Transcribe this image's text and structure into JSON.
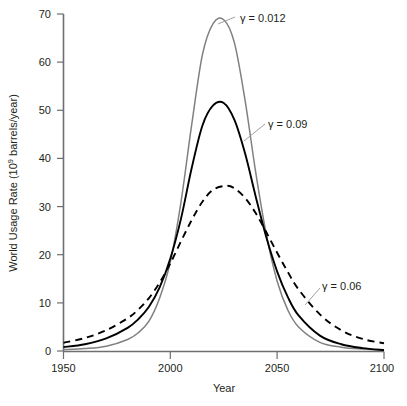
{
  "chart_data": {
    "type": "line",
    "title": "",
    "xlabel": "Year",
    "ylabel": "World Usage Rate (10⁹ barrels/year)",
    "xlim": [
      1950,
      2100
    ],
    "ylim": [
      0,
      70
    ],
    "xticks": [
      1950,
      2000,
      2050,
      2100
    ],
    "yticks": [
      0,
      10,
      20,
      30,
      40,
      50,
      60,
      70
    ],
    "grid": false,
    "legend_position": "inline-annotations",
    "series": [
      {
        "name": "γ = 0.012",
        "style": "solid",
        "color": "#808080",
        "peak_year": 2025,
        "peak_value": 68.8,
        "x": [
          1950,
          1960,
          1970,
          1980,
          1985,
          1990,
          1995,
          2000,
          2005,
          2010,
          2015,
          2020,
          2025,
          2030,
          2035,
          2040,
          2045,
          2050,
          2055,
          2060,
          2070,
          2080,
          2090,
          2100
        ],
        "y": [
          0.3,
          0.5,
          1.0,
          2.4,
          3.8,
          6.2,
          11.0,
          18.5,
          31.0,
          47.0,
          61.5,
          68.0,
          68.8,
          64.0,
          52.0,
          37.0,
          24.0,
          14.5,
          8.5,
          5.0,
          1.8,
          0.8,
          0.4,
          0.2
        ]
      },
      {
        "name": "γ = 0.09",
        "style": "solid",
        "color": "#000000",
        "peak_year": 2025,
        "peak_value": 51.5,
        "x": [
          1950,
          1960,
          1970,
          1980,
          1985,
          1990,
          1995,
          2000,
          2005,
          2010,
          2015,
          2020,
          2025,
          2030,
          2035,
          2040,
          2045,
          2050,
          2055,
          2060,
          2070,
          2080,
          2090,
          2100
        ],
        "y": [
          0.8,
          1.4,
          2.6,
          4.8,
          6.6,
          9.2,
          13.2,
          19.2,
          27.5,
          38.0,
          46.8,
          51.0,
          51.5,
          48.0,
          41.0,
          32.0,
          23.5,
          16.5,
          11.2,
          7.4,
          3.2,
          1.4,
          0.6,
          0.2
        ]
      },
      {
        "name": "γ = 0.06",
        "style": "dashed",
        "color": "#000000",
        "peak_year": 2026,
        "peak_value": 34.3,
        "x": [
          1950,
          1960,
          1970,
          1980,
          1985,
          1990,
          1995,
          2000,
          2005,
          2010,
          2015,
          2020,
          2026,
          2030,
          2035,
          2040,
          2045,
          2050,
          2055,
          2060,
          2070,
          2080,
          2090,
          2100
        ],
        "y": [
          1.7,
          2.7,
          4.3,
          6.8,
          8.6,
          11.0,
          14.2,
          18.2,
          22.8,
          27.2,
          31.0,
          33.5,
          34.3,
          33.8,
          31.8,
          28.6,
          24.6,
          20.4,
          16.4,
          12.8,
          7.6,
          4.3,
          2.5,
          1.6
        ]
      }
    ],
    "annotations": [
      {
        "text_gamma": "γ",
        "text_rest": " = 0.012",
        "label_x": 240,
        "label_y": 20
      },
      {
        "text_gamma": "γ",
        "text_rest": " = 0.09",
        "label_x": 268,
        "label_y": 127
      },
      {
        "text_gamma": "γ",
        "text_rest": " = 0.06",
        "label_x": 322,
        "label_y": 286
      }
    ]
  },
  "axes": {
    "x_title": "Year",
    "y_title_main": "World Usage Rate (10",
    "y_title_sup": "9",
    "y_title_tail": " barrels/year)",
    "x_tick_labels": [
      "1950",
      "2000",
      "2050",
      "2100"
    ],
    "y_tick_labels": [
      "0",
      "10",
      "20",
      "30",
      "40",
      "50",
      "60",
      "70"
    ]
  },
  "colors": {
    "axis": "#6d6e71",
    "curve_gray": "#808080",
    "curve_black": "#000000",
    "text": "#231f20",
    "leader": "#939598",
    "background": "#ffffff"
  }
}
